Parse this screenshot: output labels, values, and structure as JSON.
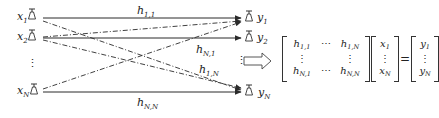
{
  "transmitters": [
    {
      "id": "x1",
      "label": "x",
      "sub": "1"
    },
    {
      "id": "x2",
      "label": "x",
      "sub": "2"
    },
    {
      "id": "xN",
      "label": "x",
      "sub": "N"
    }
  ],
  "receivers": [
    {
      "id": "y1",
      "label": "y",
      "sub": "1"
    },
    {
      "id": "y2",
      "label": "y",
      "sub": "2"
    },
    {
      "id": "yN",
      "label": "y",
      "sub": "N"
    }
  ],
  "ellipsis_left": "⋮",
  "ellipsis_right": "⋮",
  "channel_labels": {
    "h11": {
      "base": "h",
      "sub": "1,1"
    },
    "hN1": {
      "base": "h",
      "sub": "N,1"
    },
    "h1N": {
      "base": "h",
      "sub": "1,N"
    },
    "hNN": {
      "base": "h",
      "sub": "N,N"
    }
  },
  "links": [
    {
      "from": "x1",
      "to": "y1",
      "style": "solid",
      "label": "h11"
    },
    {
      "from": "x2",
      "to": "y2",
      "style": "solid"
    },
    {
      "from": "xN",
      "to": "yN",
      "style": "solid",
      "label": "hNN"
    },
    {
      "from": "x1",
      "to": "yN",
      "style": "dash-dot",
      "label": "h1N"
    },
    {
      "from": "x2",
      "to": "y1",
      "style": "dash-dot"
    },
    {
      "from": "x2",
      "to": "yN",
      "style": "dash-dot"
    },
    {
      "from": "xN",
      "to": "y1",
      "style": "dash-dot",
      "label": "hN1"
    }
  ],
  "equation": {
    "H": [
      [
        "h|1,1",
        "⋯",
        "h|1,N"
      ],
      [
        "⋮",
        "",
        "⋮"
      ],
      [
        "h|N,1",
        "⋯",
        "h|N,N"
      ]
    ],
    "x": [
      "x|1",
      "⋮",
      "x|N"
    ],
    "equals": "=",
    "y": [
      "y|1",
      "⋮",
      "y|N"
    ]
  },
  "colors": {
    "line": "#2b2b2b",
    "text": "#222222"
  }
}
